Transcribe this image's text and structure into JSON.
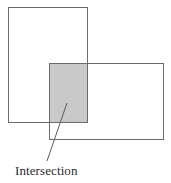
{
  "diagram": {
    "background_color": "#ffffff",
    "stroke_color": "#6b6b6b",
    "stroke_width": 1,
    "shapes": [
      {
        "name": "rectangle-a",
        "role": "upper-left set",
        "x": 8,
        "y": 7,
        "width": 79,
        "height": 115,
        "fill": "none",
        "stroke": "#6b6b6b"
      },
      {
        "name": "rectangle-b",
        "role": "lower-right set",
        "x": 49,
        "y": 63,
        "width": 114,
        "height": 76,
        "fill": "none",
        "stroke": "#6b6b6b"
      },
      {
        "name": "intersection-region",
        "role": "overlap of rectangle-a and rectangle-b",
        "x": 49,
        "y": 63,
        "width": 38,
        "height": 59,
        "fill": "#c9c9c9",
        "stroke": "#6b6b6b"
      }
    ],
    "leader_line": {
      "name": "intersection-leader-line",
      "x1": 67,
      "y1": 103,
      "x2": 47,
      "y2": 161,
      "stroke": "#5a5a6e",
      "stroke_width": 1
    },
    "labels": {
      "intersection": "Intersection"
    }
  }
}
